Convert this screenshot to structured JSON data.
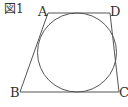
{
  "figure": {
    "caption": "図1",
    "vertices": {
      "A": {
        "label": "A",
        "x": 48,
        "y": 13
      },
      "D": {
        "label": "D",
        "x": 110,
        "y": 13
      },
      "B": {
        "label": "B",
        "x": 20,
        "y": 92
      },
      "C": {
        "label": "C",
        "x": 119,
        "y": 92
      }
    },
    "circle": {
      "cx": 77,
      "cy": 52.5,
      "r": 39.5
    },
    "stroke_color": "#555555"
  }
}
